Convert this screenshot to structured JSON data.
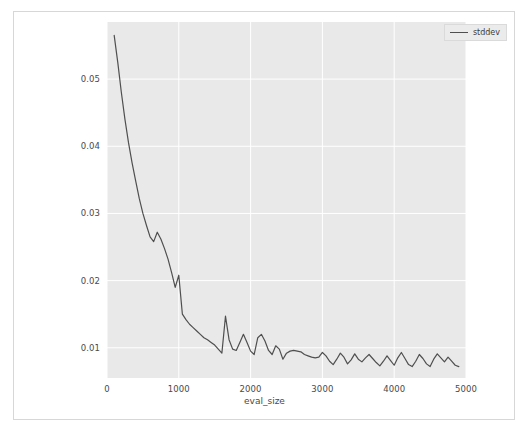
{
  "figure": {
    "background": "#ffffff",
    "plot_background": "#e9e9e9",
    "grid_color": "#ffffff",
    "line_color": "#4f4f4f",
    "border_color": "#d7d7d7"
  },
  "legend": {
    "entries": [
      {
        "label": "stddev",
        "color": "#4f4f4f"
      }
    ]
  },
  "axes": {
    "xlabel": "eval_size",
    "ylabel": "",
    "xticks": [
      "0",
      "1000",
      "2000",
      "3000",
      "4000",
      "5000"
    ],
    "yticks": [
      "0.01",
      "0.02",
      "0.03",
      "0.04",
      "0.05"
    ]
  },
  "chart_data": {
    "type": "line",
    "title": "",
    "xlabel": "eval_size",
    "ylabel": "",
    "xlim": [
      0,
      5000
    ],
    "ylim": [
      0.0055,
      0.0585
    ],
    "xticks": [
      0,
      1000,
      2000,
      3000,
      4000,
      5000
    ],
    "yticks": [
      0.01,
      0.02,
      0.03,
      0.04,
      0.05
    ],
    "grid": true,
    "legend_position": "upper right",
    "series": [
      {
        "name": "stddev",
        "color": "#4f4f4f",
        "x": [
          100,
          150,
          200,
          250,
          300,
          350,
          400,
          450,
          500,
          550,
          600,
          650,
          700,
          750,
          800,
          850,
          900,
          950,
          1000,
          1050,
          1100,
          1150,
          1200,
          1250,
          1300,
          1350,
          1400,
          1450,
          1500,
          1550,
          1600,
          1650,
          1700,
          1750,
          1800,
          1850,
          1900,
          1950,
          2000,
          2050,
          2100,
          2150,
          2200,
          2250,
          2300,
          2350,
          2400,
          2450,
          2500,
          2550,
          2600,
          2650,
          2700,
          2750,
          2800,
          2850,
          2900,
          2950,
          3000,
          3050,
          3100,
          3150,
          3200,
          3250,
          3300,
          3350,
          3400,
          3450,
          3500,
          3550,
          3600,
          3650,
          3700,
          3750,
          3800,
          3850,
          3900,
          3950,
          4000,
          4050,
          4100,
          4150,
          4200,
          4250,
          4300,
          4350,
          4400,
          4450,
          4500,
          4550,
          4600,
          4650,
          4700,
          4750,
          4800,
          4850,
          4900
        ],
        "y": [
          0.0565,
          0.0525,
          0.048,
          0.044,
          0.0405,
          0.0375,
          0.0348,
          0.0322,
          0.03,
          0.0282,
          0.0265,
          0.0258,
          0.0272,
          0.0262,
          0.0248,
          0.0232,
          0.0212,
          0.019,
          0.0208,
          0.015,
          0.0142,
          0.0135,
          0.013,
          0.0125,
          0.012,
          0.0115,
          0.0112,
          0.0108,
          0.0104,
          0.0098,
          0.0092,
          0.0147,
          0.0112,
          0.0098,
          0.0096,
          0.0108,
          0.012,
          0.0108,
          0.0095,
          0.009,
          0.0115,
          0.012,
          0.011,
          0.0096,
          0.009,
          0.0103,
          0.0098,
          0.0083,
          0.0092,
          0.0095,
          0.0096,
          0.0095,
          0.0094,
          0.009,
          0.0088,
          0.0086,
          0.0085,
          0.0086,
          0.0093,
          0.0088,
          0.008,
          0.0075,
          0.0083,
          0.0092,
          0.0086,
          0.0076,
          0.0082,
          0.0091,
          0.0083,
          0.0079,
          0.0085,
          0.009,
          0.0084,
          0.0078,
          0.0073,
          0.008,
          0.0088,
          0.0081,
          0.0074,
          0.0085,
          0.0093,
          0.0084,
          0.0075,
          0.0072,
          0.008,
          0.009,
          0.0084,
          0.0076,
          0.0072,
          0.0083,
          0.0091,
          0.0085,
          0.0079,
          0.0086,
          0.008,
          0.0074,
          0.0072
        ]
      }
    ]
  }
}
